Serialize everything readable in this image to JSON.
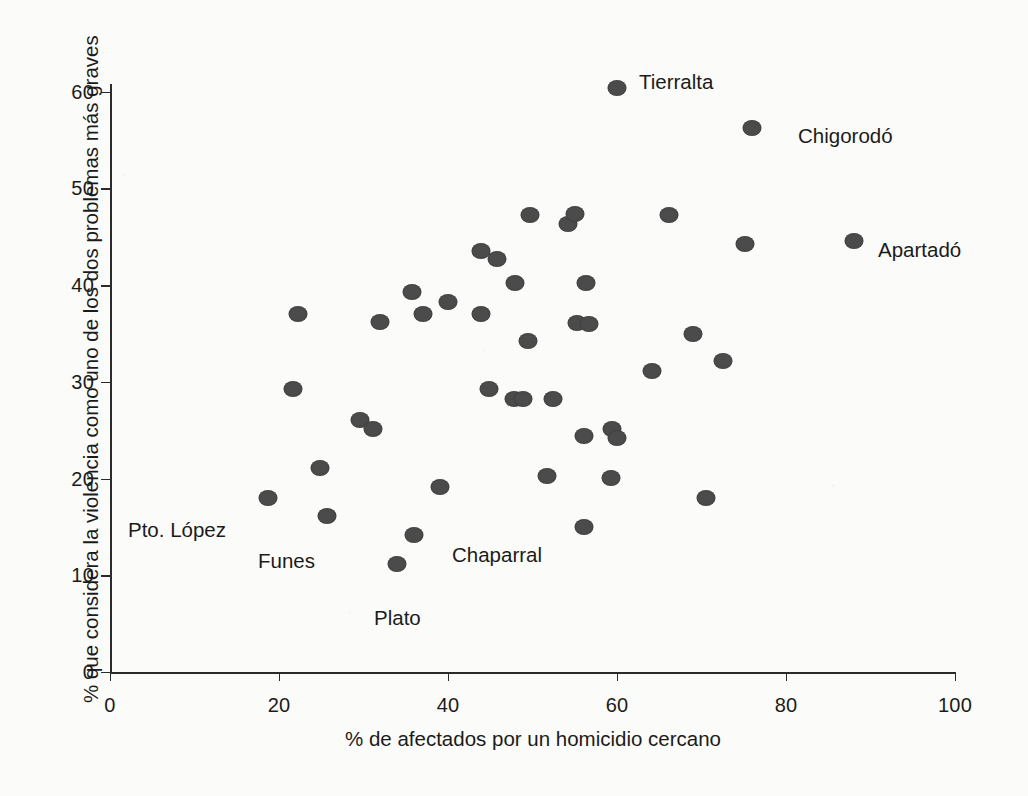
{
  "chart_data": {
    "type": "scatter",
    "title": "",
    "xlabel": "% de afectados por un homicidio cercano",
    "ylabel": "% que considera la violencia como uno de los dos problemas más graves",
    "xlim": [
      0,
      100
    ],
    "ylim": [
      0,
      62
    ],
    "xticks": [
      0,
      20,
      40,
      60,
      80,
      100
    ],
    "yticks": [
      0,
      10,
      20,
      30,
      40,
      50,
      60
    ],
    "grid": false,
    "legend": "none",
    "marker_color": "#4b4b4b",
    "axis_color": "#2b2b2b",
    "background_color": "#fbfbf9",
    "points": [
      {
        "x": 18.7,
        "y": 18.0,
        "label": "Pto. López"
      },
      {
        "x": 21.6,
        "y": 29.3,
        "label": ""
      },
      {
        "x": 22.3,
        "y": 37.0,
        "label": ""
      },
      {
        "x": 24.8,
        "y": 21.1,
        "label": ""
      },
      {
        "x": 25.7,
        "y": 16.1,
        "label": "Funes"
      },
      {
        "x": 29.6,
        "y": 26.1,
        "label": ""
      },
      {
        "x": 31.1,
        "y": 25.1,
        "label": ""
      },
      {
        "x": 32.0,
        "y": 36.2,
        "label": ""
      },
      {
        "x": 34.0,
        "y": 11.2,
        "label": "Plato"
      },
      {
        "x": 35.7,
        "y": 39.3,
        "label": ""
      },
      {
        "x": 36.0,
        "y": 14.2,
        "label": ""
      },
      {
        "x": 37.1,
        "y": 37.0,
        "label": ""
      },
      {
        "x": 39.0,
        "y": 19.1,
        "label": ""
      },
      {
        "x": 40.0,
        "y": 38.3,
        "label": ""
      },
      {
        "x": 43.9,
        "y": 37.0,
        "label": ""
      },
      {
        "x": 43.9,
        "y": 43.5,
        "label": ""
      },
      {
        "x": 44.8,
        "y": 29.3,
        "label": ""
      },
      {
        "x": 45.8,
        "y": 42.7,
        "label": ""
      },
      {
        "x": 47.8,
        "y": 28.2,
        "label": ""
      },
      {
        "x": 47.9,
        "y": 40.2,
        "label": ""
      },
      {
        "x": 48.9,
        "y": 28.2,
        "label": ""
      },
      {
        "x": 49.5,
        "y": 34.2,
        "label": ""
      },
      {
        "x": 49.7,
        "y": 47.3,
        "label": ""
      },
      {
        "x": 51.7,
        "y": 20.3,
        "label": ""
      },
      {
        "x": 52.4,
        "y": 28.2,
        "label": ""
      },
      {
        "x": 54.2,
        "y": 46.3,
        "label": ""
      },
      {
        "x": 55.0,
        "y": 47.4,
        "label": ""
      },
      {
        "x": 55.3,
        "y": 36.1,
        "label": ""
      },
      {
        "x": 56.1,
        "y": 15.0,
        "label": "Chaparral"
      },
      {
        "x": 56.1,
        "y": 24.4,
        "label": ""
      },
      {
        "x": 56.3,
        "y": 40.2,
        "label": ""
      },
      {
        "x": 56.7,
        "y": 36.0,
        "label": ""
      },
      {
        "x": 59.3,
        "y": 20.1,
        "label": ""
      },
      {
        "x": 59.4,
        "y": 25.1,
        "label": ""
      },
      {
        "x": 60.0,
        "y": 24.2,
        "label": ""
      },
      {
        "x": 60.0,
        "y": 60.4,
        "label": "Tierralta"
      },
      {
        "x": 64.1,
        "y": 31.1,
        "label": ""
      },
      {
        "x": 66.1,
        "y": 47.3,
        "label": ""
      },
      {
        "x": 69.0,
        "y": 35.0,
        "label": ""
      },
      {
        "x": 70.5,
        "y": 18.0,
        "label": ""
      },
      {
        "x": 72.5,
        "y": 32.2,
        "label": ""
      },
      {
        "x": 75.2,
        "y": 44.3,
        "label": ""
      },
      {
        "x": 76.0,
        "y": 56.2,
        "label": "Chigorodó"
      },
      {
        "x": 88.0,
        "y": 44.6,
        "label": "Apartadó"
      }
    ],
    "annotations": [
      {
        "text": "Tierralta",
        "x": 639,
        "y": 70,
        "align": "left"
      },
      {
        "text": "Chigorodó",
        "x": 798,
        "y": 124,
        "align": "left"
      },
      {
        "text": "Apartadó",
        "x": 878,
        "y": 238,
        "align": "left"
      },
      {
        "text": "Pto. López",
        "x": 128,
        "y": 518,
        "align": "left"
      },
      {
        "text": "Funes",
        "x": 258,
        "y": 549,
        "align": "left"
      },
      {
        "text": "Chaparral",
        "x": 452,
        "y": 543,
        "align": "left"
      },
      {
        "text": "Plato",
        "x": 374,
        "y": 606,
        "align": "left"
      }
    ]
  }
}
